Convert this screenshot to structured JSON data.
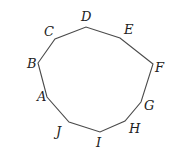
{
  "diagram": {
    "type": "decagon",
    "stroke_color": "#4a4a4a",
    "label_color": "#222222",
    "background": "#ffffff",
    "vertices": [
      {
        "name": "A",
        "x": 47,
        "y": 97,
        "lx": 37,
        "ly": 101
      },
      {
        "name": "B",
        "x": 38,
        "y": 63,
        "lx": 27,
        "ly": 68
      },
      {
        "name": "C",
        "x": 55,
        "y": 39,
        "lx": 44,
        "ly": 36
      },
      {
        "name": "D",
        "x": 86,
        "y": 27,
        "lx": 81,
        "ly": 21
      },
      {
        "name": "E",
        "x": 120,
        "y": 38,
        "lx": 124,
        "ly": 34
      },
      {
        "name": "F",
        "x": 153,
        "y": 64,
        "lx": 155,
        "ly": 72
      },
      {
        "name": "G",
        "x": 141,
        "y": 102,
        "lx": 144,
        "ly": 110
      },
      {
        "name": "H",
        "x": 125,
        "y": 121,
        "lx": 129,
        "ly": 133
      },
      {
        "name": "I",
        "x": 100,
        "y": 132,
        "lx": 96,
        "ly": 147
      },
      {
        "name": "J",
        "x": 69,
        "y": 122,
        "lx": 56,
        "ly": 136
      }
    ]
  }
}
